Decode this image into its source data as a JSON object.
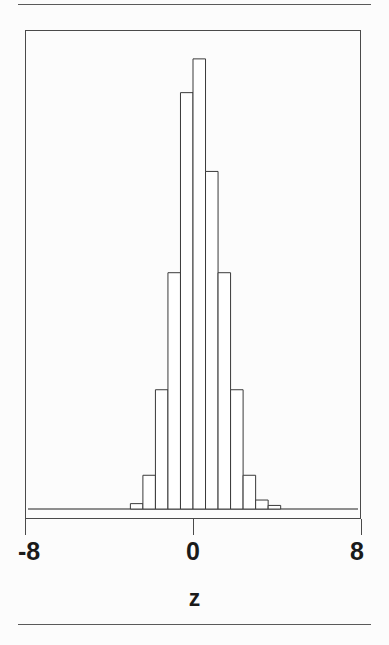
{
  "figure": {
    "background_color": "#fcfcfc",
    "frame_color": "#4a4a4a",
    "rule_color": "#5a5a5a",
    "has_top_rule": true,
    "has_bottom_rule": true
  },
  "axis": {
    "title": "z",
    "tick_labels": [
      "-8",
      "0",
      "8"
    ],
    "tick_values": [
      -8,
      0,
      8
    ]
  },
  "chart_data": {
    "type": "bar",
    "title": "",
    "subtitle": "",
    "xlabel": "z",
    "ylabel": "",
    "xlim": [
      -8,
      8
    ],
    "ylim": [
      0,
      1
    ],
    "grid": false,
    "legend": null,
    "bar_color": "#ffffff",
    "bar_edge_color": "#3a3a3a",
    "note": "Histogram of standard-normal-like variable z; bar heights are relative frequencies normalized so the tallest bar is 1.0",
    "bin_width": 0.6,
    "bin_left_edges": [
      -3.0,
      -2.4,
      -1.8,
      -1.2,
      -0.6,
      0.0,
      0.6,
      1.2,
      1.8,
      2.4,
      3.0,
      3.6
    ],
    "bin_centers": [
      -2.7,
      -2.1,
      -1.5,
      -0.9,
      -0.3,
      0.3,
      0.9,
      1.5,
      2.1,
      2.7,
      3.3,
      3.9
    ],
    "categories": [
      "-2.7",
      "-2.1",
      "-1.5",
      "-0.9",
      "-0.3",
      "0.3",
      "0.9",
      "1.5",
      "2.1",
      "2.7",
      "3.3",
      "3.9"
    ],
    "values": [
      0.012,
      0.075,
      0.265,
      0.525,
      0.925,
      1.0,
      0.75,
      0.525,
      0.265,
      0.075,
      0.02,
      0.008
    ]
  }
}
